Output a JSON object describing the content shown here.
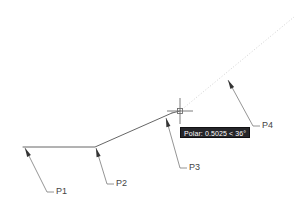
{
  "application": {
    "kind": "cad-drawing-canvas",
    "background_color": "#ffffff"
  },
  "tooltip": {
    "text": "Polar: 0.5025 < 36°",
    "background_color": "#26262a",
    "text_color": "#ffffff",
    "x": 180,
    "y": 127,
    "width": 66,
    "height": 11
  },
  "cursor": {
    "type": "crosshair",
    "x": 180,
    "y": 111,
    "arm_length": 13,
    "pick_box_size": 5,
    "color": "#6e6e6e"
  },
  "geometry": {
    "stroke_color": "#555555",
    "tracking_color": "#d2d2d2",
    "polyline": {
      "points": "23,147 95,147 172,113",
      "vertices": [
        {
          "x": 23,
          "y": 147
        },
        {
          "x": 95,
          "y": 147
        },
        {
          "x": 172,
          "y": 113
        }
      ]
    },
    "rubber_band": {
      "from_x": 172,
      "from_y": 113,
      "to_x": 180,
      "to_y": 111
    },
    "tracking_ray": {
      "from_x": 180,
      "from_y": 111,
      "to_x": 294,
      "to_y": 17,
      "angle_label": "36°",
      "dash_pattern": "1,2"
    }
  },
  "labels": [
    {
      "id": "p1",
      "text": "P1",
      "target_x": 25,
      "target_y": 148,
      "elbow_x": 47,
      "elbow_y": 192,
      "tick_x": 54,
      "tick_y": 192,
      "text_x": 56,
      "text_y": 196
    },
    {
      "id": "p2",
      "text": "P2",
      "target_x": 96,
      "target_y": 148,
      "elbow_x": 107,
      "elbow_y": 184,
      "tick_x": 114,
      "tick_y": 184,
      "text_x": 116,
      "text_y": 188
    },
    {
      "id": "p3",
      "text": "P3",
      "target_x": 166,
      "target_y": 118,
      "elbow_x": 180,
      "elbow_y": 168,
      "tick_x": 187,
      "tick_y": 168,
      "text_x": 189,
      "text_y": 172
    },
    {
      "id": "p4",
      "text": "P4",
      "target_x": 228,
      "target_y": 80,
      "elbow_x": 253,
      "elbow_y": 126,
      "tick_x": 260,
      "tick_y": 126,
      "text_x": 262,
      "text_y": 130
    }
  ],
  "label_style": {
    "font_size": 9,
    "color": "#444444",
    "leader_color": "#7a7a7a",
    "arrowhead_color": "#333333"
  }
}
